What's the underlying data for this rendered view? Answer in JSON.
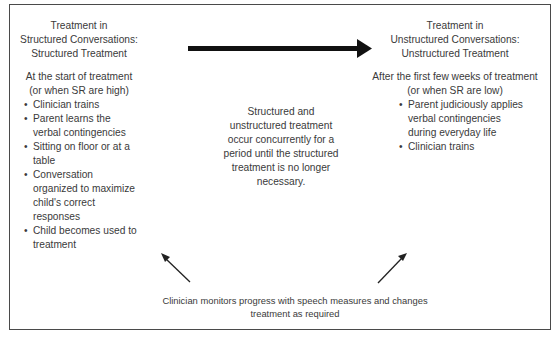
{
  "left_panel": {
    "title_lines": [
      "Treatment in",
      "Structured Conversations:",
      "Structured Treatment"
    ],
    "condition_lines": [
      "At the start of treatment",
      "(or when SR are high)"
    ],
    "bullets": [
      "Clinician trains",
      "Parent learns the verbal contingencies",
      "Sitting on floor or at a table",
      "Conversation organized to maximize child's correct responses",
      "Child becomes used to treatment"
    ]
  },
  "right_panel": {
    "title_lines": [
      "Treatment in",
      "Unstructured Conversations:",
      "Unstructured Treatment"
    ],
    "condition_lines": [
      "After the first few weeks of treatment",
      "(or when SR are low)"
    ],
    "bullets": [
      "Parent judiciously applies verbal contingencies during everyday life",
      "Clinician trains"
    ]
  },
  "center_note": "Structured and unstructured treatment occur concurrently for a period until the structured treatment is no longer necessary.",
  "bottom_note": "Clinician monitors progress with speech measures and changes treatment as required",
  "arrows": {
    "main": {
      "from": "structured-treatment",
      "to": "unstructured-treatment",
      "style": "thick"
    },
    "feedback_left": {
      "from": "bottom-note",
      "to": "structured-treatment"
    },
    "feedback_right": {
      "from": "bottom-note",
      "to": "unstructured-treatment"
    }
  },
  "colors": {
    "text": "#3a3a3a",
    "border": "#4a4a4a",
    "arrow": "#111111"
  }
}
